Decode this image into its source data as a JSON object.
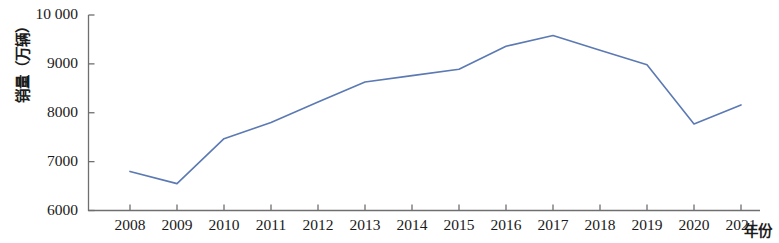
{
  "chart_data": {
    "type": "line",
    "title": "",
    "subtitle": "",
    "xlabel": "年份",
    "ylabel": "销量（万辆）",
    "categories": [
      "2008",
      "2009",
      "2010",
      "2011",
      "2012",
      "2013",
      "2014",
      "2015",
      "2016",
      "2017",
      "2018",
      "2019",
      "2020",
      "2021"
    ],
    "x": [
      2008,
      2009,
      2010,
      2011,
      2012,
      2013,
      2014,
      2015,
      2016,
      2017,
      2018,
      2019,
      2020,
      2021
    ],
    "series": [
      {
        "name": "销量",
        "color": "#5b79b3",
        "values": [
          6800,
          6550,
          7470,
          7800,
          8220,
          8630,
          8760,
          8890,
          9360,
          9580,
          9280,
          8980,
          7770,
          8160
        ]
      }
    ],
    "ylim": [
      6000,
      10000
    ],
    "yticks": [
      6000,
      7000,
      8000,
      9000,
      10000
    ],
    "ytick_labels": [
      "6000",
      "7000",
      "8000",
      "9000",
      "10 000"
    ],
    "xlim": [
      2008,
      2021
    ],
    "grid": false,
    "legend": false,
    "legend_position": "none",
    "line_color": "#5b79b3",
    "axis_color": "#6f6f6f"
  },
  "axes": {
    "y_title": "销量（万辆）",
    "x_title": "年份",
    "y_labels": [
      "10 000",
      "9000",
      "8000",
      "7000",
      "6000"
    ],
    "x_labels": [
      "2008",
      "2009",
      "2010",
      "2011",
      "2012",
      "2013",
      "2014",
      "2015",
      "2016",
      "2017",
      "2018",
      "2019",
      "2020",
      "2021"
    ]
  }
}
